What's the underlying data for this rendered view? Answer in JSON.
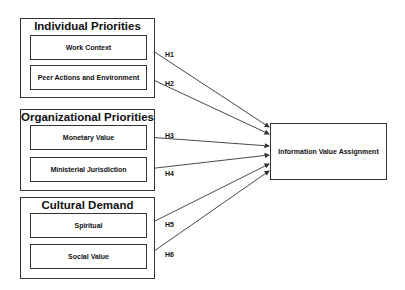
{
  "groups": [
    {
      "title": "Individual Priorities",
      "factors": [
        "Work Context",
        "Peer Actions and Environment"
      ]
    },
    {
      "title": "Organizational Priorities",
      "factors": [
        "Monetary Value",
        "Ministerial Jurisdiction"
      ]
    },
    {
      "title": "Cultural Demand",
      "factors": [
        "Spiritual",
        "Social Value"
      ]
    }
  ],
  "target": {
    "label": "Information Value Assignment"
  },
  "hypotheses": [
    "H1",
    "H2",
    "H3",
    "H4",
    "H5",
    "H6"
  ],
  "colors": {
    "line": "#333333",
    "background": "#ffffff",
    "text": "#111111"
  }
}
